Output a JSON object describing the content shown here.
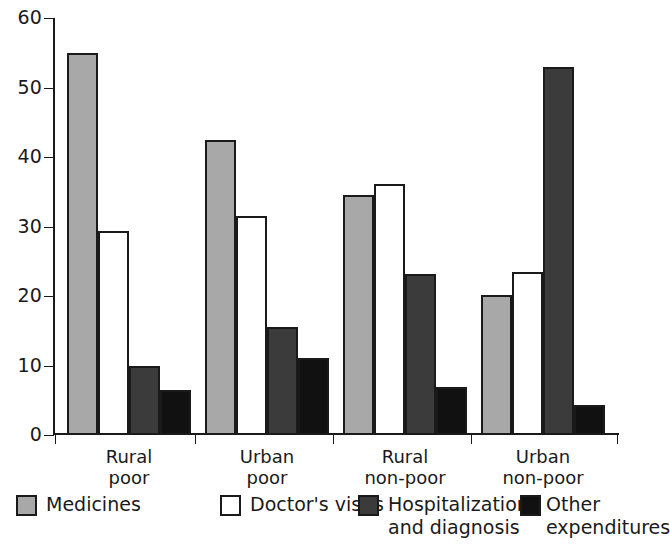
{
  "chart_data": {
    "type": "bar",
    "title": "",
    "subtitle": "",
    "xlabel": "",
    "ylabel": "",
    "ylim": [
      0,
      60
    ],
    "yticks": [
      0,
      10,
      20,
      30,
      40,
      50,
      60
    ],
    "grid": false,
    "legend_position": "bottom",
    "categories": [
      "Rural\npoor",
      "Urban\npoor",
      "Rural\nnon-poor",
      "Urban\nnon-poor"
    ],
    "category_lines": [
      [
        "Rural",
        "poor"
      ],
      [
        "Urban",
        "poor"
      ],
      [
        "Rural",
        "non-poor"
      ],
      [
        "Urban",
        "non-poor"
      ]
    ],
    "series": [
      {
        "name": "Medicines",
        "color": "#a8a8a8",
        "values": [
          55.0,
          42.5,
          34.5,
          20.2
        ]
      },
      {
        "name": "Doctor's visits",
        "color": "#ffffff",
        "values": [
          29.4,
          31.5,
          36.1,
          23.5
        ]
      },
      {
        "name": "Hospitalization and diagnosis",
        "name_lines": [
          "Hospitalization",
          "and diagnosis"
        ],
        "color": "#3b3b3b",
        "values": [
          9.9,
          15.6,
          23.2,
          53.0
        ]
      },
      {
        "name": "Other expenditures",
        "name_lines": [
          "Other",
          "expenditures"
        ],
        "color": "#111111",
        "values": [
          6.5,
          11.1,
          6.9,
          4.3
        ]
      }
    ]
  },
  "legend": {
    "items": [
      {
        "label": "Medicines",
        "swatch_color": "#a8a8a8"
      },
      {
        "label": "Doctor's visits",
        "swatch_color": "#ffffff"
      },
      {
        "label": "Hospitalization\nand diagnosis",
        "swatch_color": "#3b3b3b"
      },
      {
        "label": "Other\nexpenditures",
        "swatch_color": "#111111"
      }
    ]
  },
  "axis": {
    "y_tick_labels": [
      "60",
      "50",
      "40",
      "30",
      "20",
      "10",
      "0"
    ]
  }
}
